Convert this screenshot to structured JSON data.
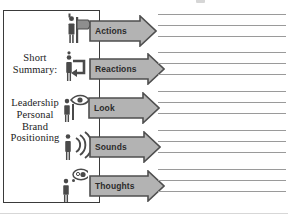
{
  "diagram": {
    "title_visible": false,
    "summary_box": {
      "label_1": "Short\nSummary:",
      "label_2": "Leadership\nPersonal\nBrand\nPositioning"
    },
    "colors": {
      "arrow_fill": "#b3b3b3",
      "arrow_stroke": "#4f4f4f",
      "box_stroke": "#3a3a3a",
      "rule_line": "#9a9a9a",
      "text": "#1b1b1b",
      "icon": "#4a4a4a",
      "background": "#ffffff"
    },
    "rows": [
      {
        "id": "actions",
        "label": "Actions",
        "icon": "person-signpost-icon",
        "icon_desc": "person standing beside a directional signpost",
        "arrow_width": 68,
        "line_count": 3
      },
      {
        "id": "reactions",
        "label": "Reactions",
        "icon": "person-circular-arrow-icon",
        "icon_desc": "person with a curved return arrow",
        "arrow_width": 76,
        "line_count": 3
      },
      {
        "id": "look",
        "label": "Look",
        "icon": "person-eye-icon",
        "icon_desc": "person with an eye symbol",
        "arrow_width": 72,
        "line_count": 3
      },
      {
        "id": "sounds",
        "label": "Sounds",
        "icon": "person-sound-waves-icon",
        "icon_desc": "person emitting sound waves",
        "arrow_width": 72,
        "line_count": 3
      },
      {
        "id": "thoughts",
        "label": "Thoughts",
        "icon": "person-thought-bubble-icon",
        "icon_desc": "person with a thought bubble",
        "arrow_width": 76,
        "line_count": 3
      }
    ]
  }
}
